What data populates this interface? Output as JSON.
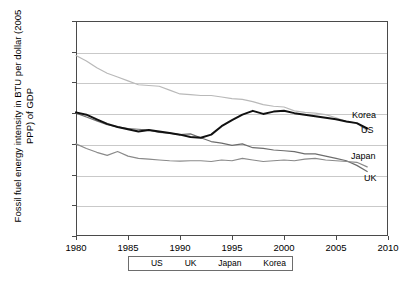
{
  "chart_data": {
    "type": "line",
    "title": "",
    "xlabel": "",
    "ylabel": "Fossil fuel energy intensity in BTU per dollar (2005 PPP) of GDP",
    "xlim": [
      1980,
      2010
    ],
    "ylim": [
      0,
      14000
    ],
    "xticks": [
      1980,
      1985,
      1990,
      1995,
      2000,
      2005,
      2010
    ],
    "yticks": [
      0,
      2000,
      4000,
      6000,
      8000,
      10000,
      12000,
      14000
    ],
    "grid": "horizontal",
    "legend_position": "bottom",
    "x": [
      1980,
      1981,
      1982,
      1983,
      1984,
      1985,
      1986,
      1987,
      1988,
      1989,
      1990,
      1991,
      1992,
      1993,
      1994,
      1995,
      1996,
      1997,
      1998,
      1999,
      2000,
      2001,
      2002,
      2003,
      2004,
      2005,
      2006,
      2007,
      2008
    ],
    "series": [
      {
        "name": "US",
        "color": "#b9b9b9",
        "width": 1.2,
        "values": [
          11750,
          11400,
          10950,
          10600,
          10350,
          10100,
          9850,
          9800,
          9750,
          9500,
          9250,
          9200,
          9150,
          9150,
          9050,
          8950,
          8900,
          8750,
          8550,
          8450,
          8400,
          8150,
          8050,
          8000,
          7900,
          7700,
          7450,
          7350,
          6850
        ]
      },
      {
        "name": "UK",
        "color": "#6d6d6d",
        "width": 1.2,
        "values": [
          8000,
          7750,
          7500,
          7250,
          7100,
          7000,
          6950,
          6900,
          6750,
          6700,
          6600,
          6650,
          6400,
          6150,
          6050,
          5900,
          6000,
          5750,
          5700,
          5600,
          5550,
          5500,
          5350,
          5350,
          5200,
          5050,
          4900,
          4600,
          4200
        ]
      },
      {
        "name": "Japan",
        "color": "#8a8a8a",
        "width": 1.2,
        "values": [
          6000,
          5700,
          5450,
          5250,
          5500,
          5200,
          5050,
          5000,
          4950,
          4900,
          4880,
          4900,
          4900,
          4850,
          4950,
          4900,
          5050,
          4950,
          4850,
          4900,
          4950,
          4900,
          5000,
          5050,
          4950,
          4900,
          4850,
          4800,
          4500
        ]
      },
      {
        "name": "Korea",
        "color": "#111111",
        "width": 2.0,
        "values": [
          8050,
          7900,
          7600,
          7300,
          7100,
          6950,
          6800,
          6900,
          6800,
          6700,
          6600,
          6450,
          6400,
          6600,
          7150,
          7550,
          7900,
          8150,
          7950,
          8100,
          8150,
          8000,
          7900,
          7800,
          7700,
          7600,
          7450,
          7350,
          7000
        ]
      }
    ],
    "series_end_labels": [
      {
        "name": "Korea",
        "x": 352,
        "y": 111
      },
      {
        "name": "US",
        "x": 361,
        "y": 126
      },
      {
        "name": "Japan",
        "x": 351,
        "y": 152
      },
      {
        "name": "UK",
        "x": 364,
        "y": 174
      }
    ]
  }
}
